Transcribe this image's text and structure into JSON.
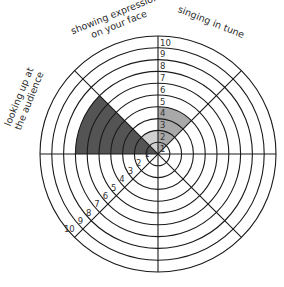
{
  "chart_data": {
    "type": "radial_sector",
    "title": "",
    "scale": {
      "min": 0,
      "max": 10,
      "rings": [
        1,
        2,
        3,
        4,
        5,
        6,
        7,
        8,
        9,
        10
      ]
    },
    "segments": 8,
    "categories": [
      {
        "label_lines": [
          "singing in tune"
        ],
        "sector_deg": [
          45,
          90
        ],
        "value": 4,
        "color": "#a9a9a9"
      },
      {
        "label_lines": [
          "showing expression",
          "on your face"
        ],
        "sector_deg": [
          90,
          135
        ],
        "value": 2,
        "color": "#d0d0d0"
      },
      {
        "label_lines": [
          "looking up at",
          "the audience"
        ],
        "sector_deg": [
          135,
          180
        ],
        "value": 7,
        "color": "#545454"
      }
    ],
    "tick_labels_vertical": [
      "1",
      "2",
      "3",
      "4",
      "5",
      "6",
      "7",
      "8",
      "9",
      "10"
    ],
    "tick_labels_diagonal": [
      "1",
      "2",
      "3",
      "4",
      "5",
      "6",
      "7",
      "8",
      "9",
      "10"
    ],
    "grid": true,
    "legend": "none"
  },
  "colors": {
    "line": "#1a1a1a",
    "background": "#ffffff"
  }
}
